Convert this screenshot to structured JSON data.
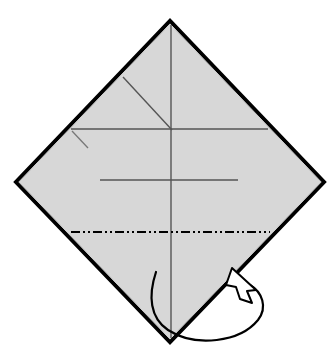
{
  "figure": {
    "kind": "origami-fold-diagram",
    "title": "Origami step diagram: square sheet rotated 45 degrees with crease lines and a fold-under arrow",
    "canvas": {
      "width": 336,
      "height": 359,
      "background": "#ffffff"
    }
  },
  "paper": {
    "name": "square-sheet-diamond",
    "fill": "#d7d7d7",
    "stroke": "#000000",
    "stroke_width": 4,
    "shape": "diamond",
    "vertices": {
      "top": {
        "x": 170,
        "y": 21
      },
      "right": {
        "x": 324,
        "y": 182
      },
      "bottom": {
        "x": 170,
        "y": 342
      },
      "left": {
        "x": 16,
        "y": 182
      }
    }
  },
  "creases": [
    {
      "id": "vertical-center-crease",
      "label": "Vertical center crease",
      "style": "valley-thin-solid",
      "color": "#555555",
      "width": 1.4,
      "from": {
        "x": 171,
        "y": 25
      },
      "to": {
        "x": 171,
        "y": 338
      }
    },
    {
      "id": "upper-horizontal-crease",
      "label": "Upper horizontal crease",
      "style": "thin-solid",
      "color": "#555555",
      "width": 1.4,
      "from": {
        "x": 71,
        "y": 129
      },
      "to": {
        "x": 268,
        "y": 129
      }
    },
    {
      "id": "diagonal-crease",
      "label": "Diagonal crease from upper-left edge to center",
      "style": "thin-solid",
      "color": "#555555",
      "width": 1.4,
      "from": {
        "x": 123,
        "y": 77
      },
      "to": {
        "x": 172,
        "y": 130
      }
    },
    {
      "id": "short-diagonal-tick",
      "label": "Short diagonal crease stub below the left horizontal end",
      "style": "thin-solid",
      "color": "#777777",
      "width": 1.3,
      "from": {
        "x": 72,
        "y": 131
      },
      "to": {
        "x": 88,
        "y": 148
      }
    },
    {
      "id": "middle-horizontal-crease",
      "label": "Middle horizontal crease",
      "style": "thin-solid",
      "color": "#555555",
      "width": 1.5,
      "from": {
        "x": 100,
        "y": 180
      },
      "to": {
        "x": 238,
        "y": 180
      }
    },
    {
      "id": "fold-line-dash-dot",
      "label": "Fold-under line (dash-dot-dot)",
      "style": "dash-dot-dot",
      "color": "#000000",
      "width": 2.1,
      "dash_pattern": "9 3 2 3 2 3",
      "from": {
        "x": 71,
        "y": 232
      },
      "to": {
        "x": 270,
        "y": 232
      }
    }
  ],
  "arrow": {
    "id": "fold-under-arrow",
    "label": "Fold-under (mountain) arrow looping behind the bottom point",
    "type": "fold-behind",
    "stroke": "#000000",
    "stroke_width": 2.2,
    "head_style": "hollow-open",
    "head_fill": "#ffffff",
    "tail_start": {
      "x": 156,
      "y": 272
    },
    "tip": {
      "x": 233,
      "y": 269
    },
    "path": "M156,272 C148,296 150,318 168,330 C196,348 240,342 258,320 C268,307 262,292 250,285"
  },
  "annotations": {
    "labels": [],
    "step_number": ""
  }
}
